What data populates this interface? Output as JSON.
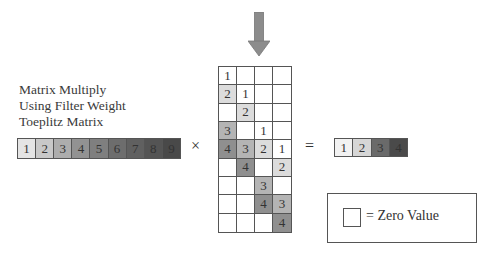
{
  "arrow": {
    "icon": "down-arrow-icon",
    "color": "#8c8c8c"
  },
  "caption": {
    "lines": [
      "Matrix Multiply",
      "Using Filter Weight",
      "Toeplitz Matrix"
    ]
  },
  "input_vector": {
    "values": [
      "1",
      "2",
      "3",
      "4",
      "5",
      "6",
      "7",
      "8",
      "9"
    ],
    "colors": [
      "#e4e4e4",
      "#c8c8c8",
      "#adadad",
      "#929292",
      "#7f7f7f",
      "#6d6d6d",
      "#606060",
      "#545454",
      "#494949"
    ]
  },
  "operators": {
    "multiply": "×",
    "equals": "="
  },
  "toeplitz_matrix": {
    "rows": 9,
    "cols": 4,
    "cells": [
      [
        "1",
        "",
        "",
        ""
      ],
      [
        "2",
        "1",
        "",
        ""
      ],
      [
        "",
        "2",
        "",
        ""
      ],
      [
        "3",
        "",
        "1",
        ""
      ],
      [
        "4",
        "3",
        "2",
        "1"
      ],
      [
        "",
        "4",
        "",
        "2"
      ],
      [
        "",
        "",
        "3",
        ""
      ],
      [
        "",
        "",
        "4",
        "3"
      ],
      [
        "",
        "",
        "",
        "4"
      ]
    ],
    "value_colors": {
      "1": "#ffffff",
      "2": "#dcdcdc",
      "3": "#b4b4b4",
      "4": "#8f8f8f",
      "": "#ffffff"
    }
  },
  "output_vector": {
    "values": [
      "1",
      "2",
      "3",
      "4"
    ],
    "colors": [
      "#f2f2f2",
      "#d6d6d6",
      "#6a6a6a",
      "#4a4a4a"
    ]
  },
  "legend": {
    "symbol": "=",
    "label": "= Zero Value"
  }
}
